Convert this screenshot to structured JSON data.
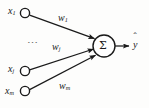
{
  "figure": {
    "background_color": "#fdfdfc",
    "stroke_color": "#1a1a1a",
    "node_fill": "#ffffff"
  },
  "inputs": [
    {
      "id": "x1",
      "base": "x",
      "subscript": "1",
      "label": "x1",
      "cx": 25,
      "cy": 13,
      "r": 4.6
    },
    {
      "id": "xj",
      "base": "x",
      "subscript": "j",
      "label": "xj",
      "cx": 25,
      "cy": 71,
      "r": 4.6
    },
    {
      "id": "xm",
      "base": "x",
      "subscript": "m",
      "label": "xm",
      "cx": 25,
      "cy": 91,
      "r": 4.6
    }
  ],
  "ellipsis": {
    "glyph": "⋯",
    "meaning": "additional-inputs-omitted",
    "x": 27,
    "y": 40
  },
  "weights": [
    {
      "id": "w1",
      "base": "w",
      "subscript": "1",
      "label": "w1",
      "x": 58,
      "y": 18,
      "edge_from": "x1",
      "edge_to": "sigma"
    },
    {
      "id": "wj",
      "base": "w",
      "subscript": "j",
      "label": "wj",
      "x": 53,
      "y": 47,
      "edge_from": "xj",
      "edge_to": "sigma"
    },
    {
      "id": "wm",
      "base": "w",
      "subscript": "m",
      "label": "wm",
      "x": 60,
      "y": 84,
      "edge_from": "xm",
      "edge_to": "sigma"
    }
  ],
  "summation_node": {
    "glyph": "Σ",
    "name": "summation",
    "cx": 104,
    "cy": 46,
    "r": 11
  },
  "output": {
    "base": "y",
    "accent": "hat",
    "label": "ŷ",
    "x": 134,
    "y": 41,
    "arrow_from_x": 115,
    "arrow_to_x": 128,
    "arrow_y": 46
  },
  "edges": [
    {
      "from": "x1",
      "to": "sigma",
      "arrowhead": true
    },
    {
      "from": "xj",
      "to": "sigma",
      "arrowhead": true
    },
    {
      "from": "xm",
      "to": "sigma",
      "arrowhead": true
    },
    {
      "from": "sigma",
      "to": "output",
      "arrowhead": true
    }
  ]
}
